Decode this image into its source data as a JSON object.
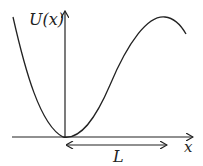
{
  "diagram": {
    "y_axis_label": "U(x)",
    "x_axis_label": "x",
    "distance_label": "L",
    "colors": {
      "stroke": "#222222",
      "background": "#ffffff"
    }
  }
}
